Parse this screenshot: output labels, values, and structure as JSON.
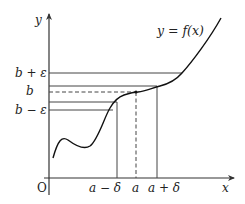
{
  "diagram": {
    "axes": {
      "x_label": "x",
      "y_label": "y",
      "origin_label": "O"
    },
    "curve_label": "y = f(x)",
    "y_labels": {
      "b_plus_eps": "b + ε",
      "b": "b",
      "b_minus_eps": "b − ε"
    },
    "x_labels": {
      "a_minus_delta": "a − δ",
      "a": "a",
      "a_plus_delta": "a + δ"
    },
    "colors": {
      "line": "#333333",
      "curve": "#111111",
      "background": "#ffffff"
    }
  }
}
